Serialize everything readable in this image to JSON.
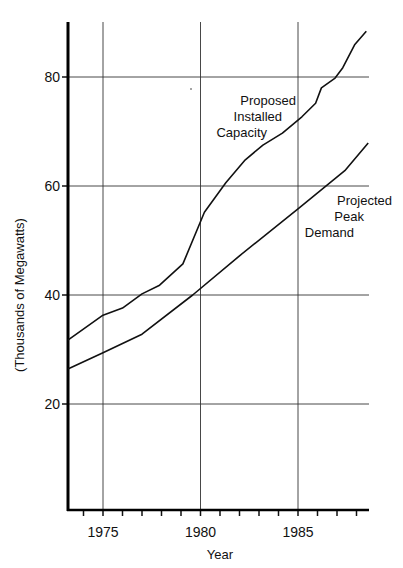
{
  "chart_data": {
    "type": "line",
    "title": "",
    "xlabel": "Year",
    "ylabel": "(Thousands of Megawatts)",
    "xlim": [
      1973.2,
      1988.6
    ],
    "ylim": [
      0,
      90
    ],
    "x_ticks": [
      1975,
      1980,
      1985
    ],
    "y_ticks": [
      20,
      40,
      60,
      80
    ],
    "grid": true,
    "series": [
      {
        "name": "Proposed Installed Capacity",
        "label_lines": [
          "Proposed",
          "Installed",
          "Capacity"
        ],
        "points": [
          [
            1973.2,
            31.7
          ],
          [
            1975.0,
            36.3
          ],
          [
            1976.0,
            37.6
          ],
          [
            1977.0,
            40.2
          ],
          [
            1977.9,
            41.8
          ],
          [
            1979.1,
            45.7
          ],
          [
            1980.2,
            55.2
          ],
          [
            1981.3,
            60.6
          ],
          [
            1982.3,
            64.8
          ],
          [
            1983.2,
            67.5
          ],
          [
            1984.2,
            69.7
          ],
          [
            1985.2,
            72.7
          ],
          [
            1985.9,
            75.2
          ],
          [
            1986.2,
            78.0
          ],
          [
            1986.9,
            79.8
          ],
          [
            1987.3,
            81.7
          ],
          [
            1987.9,
            85.9
          ],
          [
            1988.5,
            88.4
          ]
        ]
      },
      {
        "name": "Projected Peak Demand",
        "label_lines": [
          "Projected",
          "Peak",
          "Demand"
        ],
        "points": [
          [
            1973.2,
            26.4
          ],
          [
            1975.0,
            29.4
          ],
          [
            1977.0,
            32.8
          ],
          [
            1979.6,
            40.0
          ],
          [
            1982.0,
            47.2
          ],
          [
            1985.0,
            55.8
          ],
          [
            1987.4,
            62.8
          ],
          [
            1988.6,
            67.9
          ]
        ]
      }
    ]
  }
}
